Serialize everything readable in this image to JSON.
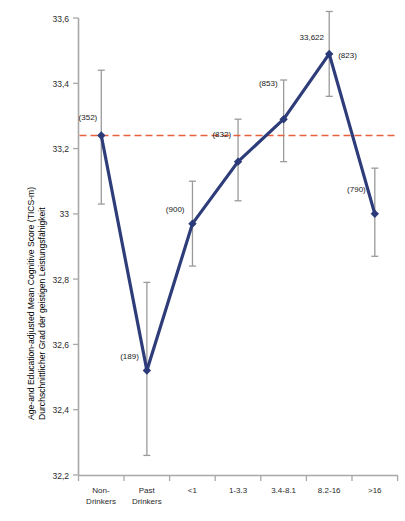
{
  "chart_data": {
    "type": "line",
    "title": "",
    "subtitle": "",
    "xlabel": "",
    "ylabel_line1": "Age-and Education-adjusted Mean Cognitive Score  (TICS-m)",
    "ylabel_line2": "Durchschnittlicher Grad  der geistigen Leistungsfähigkeit",
    "categories": [
      "Non-\nDrinkers",
      "Past\nDrinkers",
      "<1",
      "1-3.3",
      "3.4-8.1",
      "8.2-16",
      ">16"
    ],
    "category_labels": [
      {
        "line1": "Non-",
        "line2": "Drinkers"
      },
      {
        "line1": "Past",
        "line2": "Drinkers"
      },
      {
        "line1": "<1",
        "line2": ""
      },
      {
        "line1": "1-3.3",
        "line2": ""
      },
      {
        "line1": "3.4-8.1",
        "line2": ""
      },
      {
        "line1": "8.2-16",
        "line2": ""
      },
      {
        "line1": ">16",
        "line2": ""
      }
    ],
    "values": [
      33.24,
      32.52,
      32.97,
      33.16,
      33.29,
      33.49,
      33.0
    ],
    "error_low": [
      33.03,
      32.26,
      32.84,
      33.04,
      33.16,
      33.36,
      32.87
    ],
    "error_high": [
      33.44,
      32.79,
      33.1,
      33.29,
      33.41,
      33.62,
      33.14
    ],
    "point_labels": [
      "(352)",
      "(189)",
      "(900)",
      "(832)",
      "(853)",
      "(823)",
      "(790)"
    ],
    "annotation_peak": "33,622",
    "reference_line_value": 33.24,
    "ylim": [
      32.2,
      33.6
    ],
    "ytick_values": [
      33.6,
      33.4,
      33.2,
      33.0,
      32.8,
      32.6,
      32.4,
      32.2
    ],
    "ytick_labels": [
      "33,6",
      "33,4",
      "33,2",
      "33",
      "32,8",
      "32,6",
      "32,4",
      "32,2"
    ],
    "grid": false,
    "legend": "none",
    "colors": {
      "line": "#2e3d7a",
      "marker": "#2b3a78",
      "reference_line": "#e8603c",
      "error_bar": "#9a9a9a",
      "axis": "#a8a8a8"
    }
  }
}
